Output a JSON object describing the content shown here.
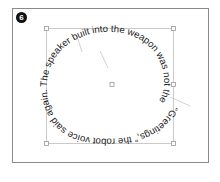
{
  "figure": {
    "step_number": "6",
    "spiral_text": "“Greetings,” the robot voice said again. The speaker built into the weapon was not the",
    "colors": {
      "frame": "#8a8a8a",
      "selection": "#b8b8b8",
      "text": "#1a1a1a",
      "badge": "#111111"
    }
  }
}
